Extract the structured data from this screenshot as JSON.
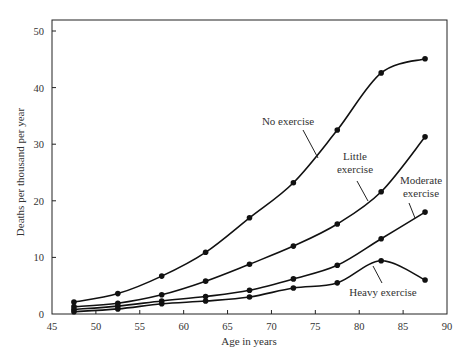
{
  "chart_data": {
    "type": "line",
    "title": "",
    "xlabel": "Age in years",
    "ylabel": "Deaths per thousand per year",
    "xlim": [
      45,
      90
    ],
    "ylim": [
      0,
      52
    ],
    "xticks": [
      45,
      50,
      55,
      60,
      65,
      70,
      75,
      80,
      85,
      90
    ],
    "yticks": [
      0,
      10,
      20,
      30,
      40,
      50
    ],
    "grid": false,
    "legend": "inline annotations",
    "x": [
      47.5,
      52.5,
      57.5,
      62.5,
      67.5,
      72.5,
      77.5,
      82.5,
      87.5
    ],
    "series": [
      {
        "name": "No exercise",
        "values": [
          2.1,
          3.6,
          6.7,
          10.9,
          17.0,
          23.2,
          32.5,
          42.6,
          45.1
        ],
        "label": {
          "lines": [
            "No exercise"
          ],
          "x": 288,
          "y": 125,
          "arrow": [
            [
              303,
              130
            ],
            [
              318,
              158
            ]
          ]
        }
      },
      {
        "name": "Little exercise",
        "values": [
          1.3,
          1.9,
          3.4,
          5.8,
          8.8,
          12.0,
          15.9,
          21.6,
          31.3
        ],
        "label": {
          "lines": [
            "Little",
            "exercise"
          ],
          "x": 355,
          "y": 160,
          "arrow": [
            [
              357,
              181
            ],
            [
              368,
              201
            ]
          ]
        }
      },
      {
        "name": "Moderate exercise",
        "values": [
          0.8,
          1.4,
          2.3,
          3.1,
          4.2,
          6.2,
          8.6,
          13.3,
          18.0
        ],
        "label": {
          "lines": [
            "Moderate",
            "exercise"
          ],
          "x": 421,
          "y": 184,
          "arrow": [
            [
              409,
              203
            ],
            [
              415,
              218
            ]
          ]
        }
      },
      {
        "name": "Heavy exercise",
        "values": [
          0.4,
          0.9,
          1.8,
          2.3,
          3.0,
          4.6,
          5.5,
          9.4,
          6.0
        ],
        "label": {
          "lines": [
            "Heavy exercise"
          ],
          "x": 383,
          "y": 296,
          "arrow": [
            [
              382,
              283
            ],
            [
              373,
              266
            ]
          ]
        }
      }
    ]
  }
}
